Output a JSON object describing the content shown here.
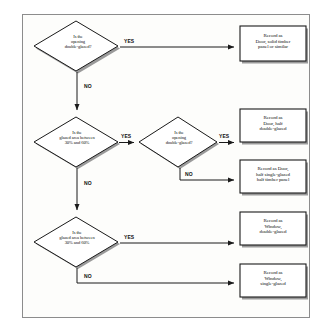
{
  "diagram": {
    "type": "flowchart",
    "decisions": [
      {
        "id": "d1",
        "lines": [
          "Is the",
          "opening",
          "double-glazed?"
        ]
      },
      {
        "id": "d2",
        "lines": [
          "Is the",
          "glazed area between",
          "30% and 60%"
        ]
      },
      {
        "id": "d3",
        "lines": [
          "Is the",
          "opening",
          "double-glazed?"
        ]
      },
      {
        "id": "d4",
        "lines": [
          "Is the",
          "glazed area between",
          "30% and 60%"
        ]
      }
    ],
    "results": [
      {
        "id": "r1",
        "lines": [
          "Record as",
          "Door, solid timber",
          "panel or similar"
        ]
      },
      {
        "id": "r2",
        "lines": [
          "Record as",
          "Door, half",
          "double-glazed"
        ]
      },
      {
        "id": "r3",
        "lines": [
          "Record as Door,",
          "half single-glazed",
          "half timber panel"
        ]
      },
      {
        "id": "r4",
        "lines": [
          "Record as",
          "Window,",
          "double-glazed"
        ]
      },
      {
        "id": "r5",
        "lines": [
          "Record as",
          "Window,",
          "single-glazed"
        ]
      }
    ],
    "edges": [
      {
        "id": "e1",
        "label": "YES",
        "from": "d1",
        "to": "r1"
      },
      {
        "id": "e2",
        "label": "NO",
        "from": "d1",
        "to": "d2"
      },
      {
        "id": "e3",
        "label": "YES",
        "from": "d2",
        "to": "d3"
      },
      {
        "id": "e4",
        "label": "NO",
        "from": "d2",
        "to": "d4"
      },
      {
        "id": "e5",
        "label": "YES",
        "from": "d3",
        "to": "r2"
      },
      {
        "id": "e6",
        "label": "NO",
        "from": "d3",
        "to": "r3"
      },
      {
        "id": "e7",
        "label": "YES",
        "from": "d4",
        "to": "r4"
      },
      {
        "id": "e8",
        "label": "NO",
        "from": "d4",
        "to": "r5"
      }
    ],
    "colors": {
      "stroke": "#1a1a1a",
      "node_fill": "#ffffff",
      "shadow": "#9a9a9a",
      "frame": "#8c8c8c",
      "page_background": "#ffffff",
      "figure_background": "#fdfdfb"
    }
  }
}
